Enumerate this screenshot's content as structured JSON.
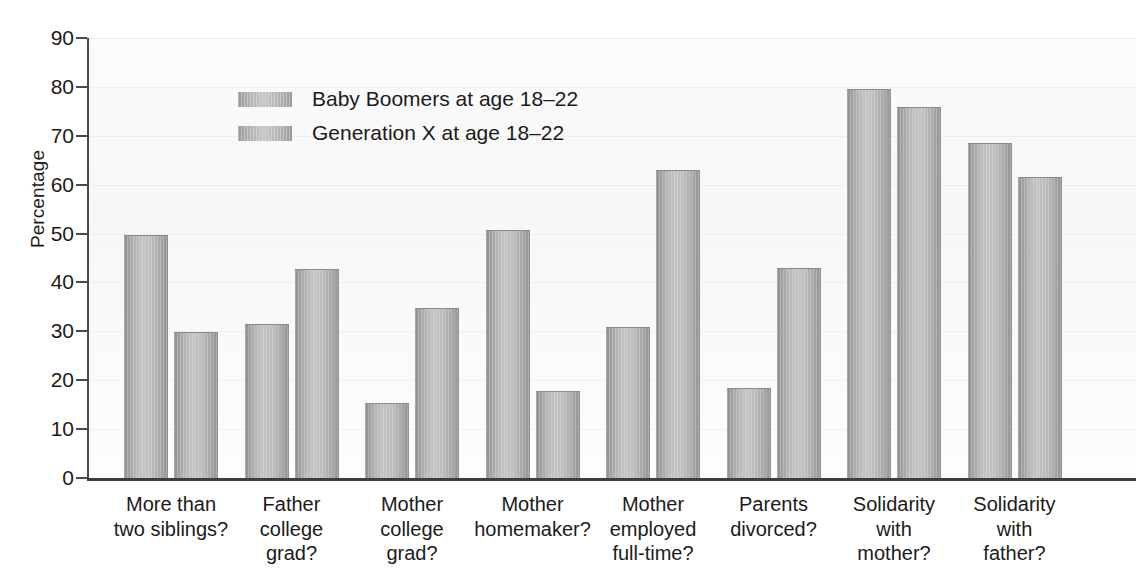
{
  "chart_data": {
    "type": "bar",
    "title": "",
    "xlabel": "",
    "ylabel": "Percentage",
    "ylim": [
      0,
      90
    ],
    "ytick_step": 10,
    "yticks": [
      90,
      80,
      70,
      60,
      50,
      40,
      30,
      20,
      10,
      0
    ],
    "grid": true,
    "legend_position": "upper-left-inside",
    "categories": [
      "More than two siblings?",
      "Father college grad?",
      "Mother college grad?",
      "Mother homemaker?",
      "Mother employed full-time?",
      "Parents divorced?",
      "Solidarity with mother?",
      "Solidarity with father?"
    ],
    "category_lines": [
      [
        "More than",
        "two siblings?"
      ],
      [
        "Father",
        "college",
        "grad?"
      ],
      [
        "Mother",
        "college",
        "grad?"
      ],
      [
        "Mother",
        "homemaker?"
      ],
      [
        "Mother",
        "employed",
        "full-time?"
      ],
      [
        "Parents",
        "divorced?"
      ],
      [
        "Solidarity",
        "with",
        "mother?"
      ],
      [
        "Solidarity",
        "with",
        "father?"
      ]
    ],
    "series": [
      {
        "name": "Baby Boomers at age 18–22",
        "values": [
          49.8,
          31.5,
          15.4,
          50.8,
          30.8,
          18.4,
          79.6,
          68.5
        ]
      },
      {
        "name": "Generation X at age 18–22",
        "values": [
          29.9,
          42.7,
          34.8,
          17.8,
          63.0,
          43.0,
          75.9,
          61.6
        ]
      }
    ],
    "colors": {
      "bar_fill_light": "#c3c3c3",
      "bar_fill_dark": "#8e8e8e",
      "axis": "#3d3d3d",
      "text": "#1b1b1b",
      "plot_background": "#f8f8f8"
    }
  },
  "legend": {
    "entries": [
      {
        "label": "Baby Boomers at age 18–22"
      },
      {
        "label": "Generation X at age 18–22"
      }
    ]
  },
  "axis": {
    "y_title": "Percentage"
  }
}
